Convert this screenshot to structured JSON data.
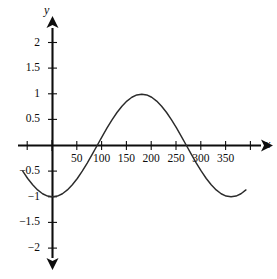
{
  "chart_data": {
    "type": "line",
    "title": "",
    "subtitle": "",
    "xlabel": "x",
    "ylabel": "y",
    "function": "y = -cos(x)",
    "x_unit": "degrees",
    "xlim": [
      -60,
      390
    ],
    "ylim": [
      -2.35,
      2.35
    ],
    "grid": false,
    "legend": null,
    "axis_style": "arrowed-cartesian-axes",
    "xticks": [
      50,
      100,
      150,
      200,
      250,
      300,
      350
    ],
    "xtick_labels": [
      "50",
      "100",
      "150",
      "200",
      "250",
      "300",
      "350"
    ],
    "xticks_unlabeled": [
      -50,
      0,
      400
    ],
    "yticks": [
      2,
      1.5,
      1,
      0.5,
      -0.5,
      -1,
      -1.5,
      -2
    ],
    "ytick_labels": [
      "2",
      "1.5",
      "1",
      "0.5",
      "−0.5",
      "−1",
      "−1.5",
      "−2"
    ],
    "series": [
      {
        "name": "y = -cos(x)",
        "color": "#2b2b2b",
        "x": [
          -60,
          -50,
          -40,
          -30,
          -20,
          -10,
          0,
          10,
          20,
          30,
          40,
          50,
          60,
          70,
          80,
          90,
          100,
          110,
          120,
          130,
          140,
          150,
          160,
          170,
          180,
          190,
          200,
          210,
          220,
          230,
          240,
          250,
          260,
          270,
          280,
          290,
          300,
          310,
          320,
          330,
          340,
          350,
          360,
          370,
          380,
          390
        ],
        "values": [
          -0.5,
          -0.643,
          -0.766,
          -0.866,
          -0.94,
          -0.985,
          -1,
          -0.985,
          -0.94,
          -0.866,
          -0.766,
          -0.643,
          -0.5,
          -0.342,
          -0.174,
          0,
          0.174,
          0.342,
          0.5,
          0.643,
          0.766,
          0.866,
          0.94,
          0.985,
          1,
          0.985,
          0.94,
          0.866,
          0.766,
          0.643,
          0.5,
          0.342,
          0.174,
          0,
          -0.174,
          -0.342,
          -0.5,
          -0.643,
          -0.766,
          -0.866,
          -0.94,
          -0.985,
          -1,
          -0.985,
          -0.94,
          -0.866
        ]
      }
    ],
    "key_points": {
      "minimum_1": {
        "x": 0,
        "y": -1
      },
      "zero_crossing_1": {
        "x": 90,
        "y": 0
      },
      "maximum": {
        "x": 180,
        "y": 1
      },
      "zero_crossing_2": {
        "x": 270,
        "y": 0
      },
      "minimum_2": {
        "x": 360,
        "y": -1
      }
    },
    "amplitude": 1,
    "period": 360
  }
}
